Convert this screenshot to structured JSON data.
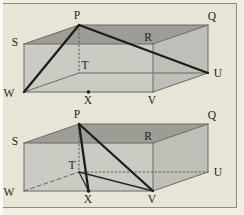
{
  "panel": {
    "background_outer": "#f2efe2",
    "background_page": "#e9e5d6",
    "left_strip": "#fbfaf4",
    "frame_color": "#8b8b85"
  },
  "diagram": {
    "colors": {
      "face_top": "#9d9c95",
      "face_front": "#cbcac3",
      "face_right": "#bfbeb7",
      "label": "#1f1f1d",
      "marker": "#1d1d1b"
    },
    "edge_styles": {
      "thin": {
        "stroke": "#6b6b65",
        "width": 1
      },
      "dotted": {
        "stroke": "#5f5f59",
        "width": 1,
        "dash": "1.6 2.4"
      },
      "dashed": {
        "stroke": "#63635d",
        "width": 1,
        "dash": "4 3"
      },
      "medium": {
        "stroke": "#2a2a27",
        "width": 1.3
      },
      "thick": {
        "stroke": "#1d1d1b",
        "width": 2.3
      }
    },
    "figures": [
      {
        "id": "upper-prism-figure",
        "vertices": {
          "P": [
            79,
            25
          ],
          "Q": [
            208,
            25
          ],
          "R": [
            153,
            44
          ],
          "S": [
            24,
            44
          ],
          "T": [
            79,
            73
          ],
          "U": [
            208,
            73
          ],
          "V": [
            153,
            92
          ],
          "W": [
            24,
            92
          ],
          "X": [
            88.5,
            92
          ]
        },
        "faces": [
          {
            "name": "front-face",
            "verts": [
              "S",
              "R",
              "V",
              "W"
            ],
            "fill": "front"
          },
          {
            "name": "right-face",
            "verts": [
              "R",
              "Q",
              "U",
              "V"
            ],
            "fill": "right"
          },
          {
            "name": "top-face",
            "verts": [
              "S",
              "P",
              "Q",
              "R"
            ],
            "fill": "top"
          }
        ],
        "edges": [
          {
            "a": "W",
            "b": "T",
            "style": "thin"
          },
          {
            "a": "T",
            "b": "U",
            "style": "thin"
          },
          {
            "a": "P",
            "b": "T",
            "style": "dotted"
          },
          {
            "a": "S",
            "b": "P",
            "style": "thin"
          },
          {
            "a": "P",
            "b": "Q",
            "style": "thin"
          },
          {
            "a": "Q",
            "b": "U",
            "style": "thin"
          },
          {
            "a": "U",
            "b": "V",
            "style": "thin"
          },
          {
            "a": "V",
            "b": "W",
            "style": "thin"
          },
          {
            "a": "W",
            "b": "S",
            "style": "thin"
          },
          {
            "a": "S",
            "b": "R",
            "style": "thin"
          },
          {
            "a": "R",
            "b": "Q",
            "style": "thin"
          },
          {
            "a": "R",
            "b": "V",
            "style": "thin"
          },
          {
            "a": "P",
            "b": "W",
            "style": "thick"
          },
          {
            "a": "P",
            "b": "U",
            "style": "thick"
          }
        ],
        "markers": [
          {
            "at": "X",
            "r": 1.8
          }
        ],
        "labels": [
          {
            "text": "P",
            "x": 77,
            "y": 19
          },
          {
            "text": "Q",
            "x": 212,
            "y": 20
          },
          {
            "text": "S",
            "x": 15,
            "y": 46
          },
          {
            "text": "R",
            "x": 148,
            "y": 41
          },
          {
            "text": "T",
            "x": 85,
            "y": 69
          },
          {
            "text": "U",
            "x": 218,
            "y": 77
          },
          {
            "text": "W",
            "x": 9,
            "y": 97
          },
          {
            "text": "X",
            "x": 88,
            "y": 104
          },
          {
            "text": "V",
            "x": 152,
            "y": 104
          }
        ]
      },
      {
        "id": "lower-prism-figure",
        "vertices": {
          "P": [
            79,
            124
          ],
          "Q": [
            208,
            124
          ],
          "R": [
            153,
            143
          ],
          "S": [
            24,
            143
          ],
          "T": [
            79,
            172
          ],
          "U": [
            208,
            172
          ],
          "V": [
            153,
            191
          ],
          "W": [
            24,
            191
          ],
          "X": [
            88.5,
            191
          ]
        },
        "faces": [
          {
            "name": "front-face",
            "verts": [
              "S",
              "R",
              "V",
              "W"
            ],
            "fill": "front"
          },
          {
            "name": "right-face",
            "verts": [
              "R",
              "Q",
              "U",
              "V"
            ],
            "fill": "right"
          },
          {
            "name": "top-face",
            "verts": [
              "S",
              "P",
              "Q",
              "R"
            ],
            "fill": "top"
          }
        ],
        "edges": [
          {
            "a": "W",
            "b": "T",
            "style": "dashed"
          },
          {
            "a": "T",
            "b": "U",
            "style": "dotted"
          },
          {
            "a": "P",
            "b": "T",
            "style": "dotted"
          },
          {
            "a": "S",
            "b": "P",
            "style": "thin"
          },
          {
            "a": "P",
            "b": "Q",
            "style": "thin"
          },
          {
            "a": "Q",
            "b": "U",
            "style": "thin"
          },
          {
            "a": "U",
            "b": "V",
            "style": "thin"
          },
          {
            "a": "V",
            "b": "W",
            "style": "thin"
          },
          {
            "a": "W",
            "b": "S",
            "style": "thin"
          },
          {
            "a": "S",
            "b": "R",
            "style": "thin"
          },
          {
            "a": "R",
            "b": "Q",
            "style": "thin"
          },
          {
            "a": "R",
            "b": "V",
            "style": "thin"
          },
          {
            "a": "T",
            "b": "X",
            "style": "medium"
          },
          {
            "a": "T",
            "b": "V",
            "style": "medium"
          },
          {
            "a": "P",
            "b": "X",
            "style": "thick"
          },
          {
            "a": "P",
            "b": "V",
            "style": "thick"
          }
        ],
        "markers": [
          {
            "at": "X",
            "r": 1.8
          }
        ],
        "labels": [
          {
            "text": "P",
            "x": 77,
            "y": 118
          },
          {
            "text": "Q",
            "x": 212,
            "y": 119
          },
          {
            "text": "S",
            "x": 15,
            "y": 145
          },
          {
            "text": "R",
            "x": 148,
            "y": 140
          },
          {
            "text": "T",
            "x": 72,
            "y": 169
          },
          {
            "text": "U",
            "x": 218,
            "y": 176
          },
          {
            "text": "W",
            "x": 9,
            "y": 196
          },
          {
            "text": "X",
            "x": 88,
            "y": 203
          },
          {
            "text": "V",
            "x": 152,
            "y": 203
          }
        ]
      }
    ]
  }
}
